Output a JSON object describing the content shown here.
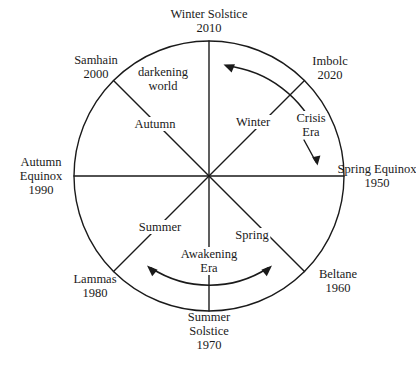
{
  "figure": {
    "background_color": "#ffffff",
    "stroke_color": "#1a1a1a",
    "circle": {
      "center_x": 209,
      "center_y": 176,
      "radius": 135
    }
  },
  "outer_labels": [
    {
      "name": "winter-solstice",
      "lines": [
        "Winter Solstice",
        "2010"
      ],
      "year": "2010",
      "angle_deg": 90,
      "x": 209,
      "y": 21
    },
    {
      "name": "imbolc",
      "lines": [
        "Imbolc",
        "2020"
      ],
      "year": "2020",
      "angle_deg": 45,
      "x": 330,
      "y": 68
    },
    {
      "name": "spring-equinox",
      "lines": [
        "Spring Equinox",
        "1950"
      ],
      "year": "1950",
      "angle_deg": 0,
      "x": 377,
      "y": 176
    },
    {
      "name": "beltane",
      "lines": [
        "Beltane",
        "1960"
      ],
      "year": "1960",
      "angle_deg": -45,
      "x": 338,
      "y": 281
    },
    {
      "name": "summer-solstice",
      "lines": [
        "Summer",
        "Solstice",
        "1970"
      ],
      "year": "1970",
      "angle_deg": -90,
      "x": 209,
      "y": 331
    },
    {
      "name": "lammas",
      "lines": [
        "Lammas",
        "1980"
      ],
      "year": "1980",
      "angle_deg": -135,
      "x": 95,
      "y": 286
    },
    {
      "name": "autumn-equinox",
      "lines": [
        "Autumn",
        "Equinox",
        "1990"
      ],
      "year": "1990",
      "angle_deg": 180,
      "x": 41,
      "y": 176
    },
    {
      "name": "samhain",
      "lines": [
        "Samhain",
        "2000"
      ],
      "year": "2000",
      "angle_deg": 135,
      "x": 96,
      "y": 67
    }
  ],
  "inner_labels": [
    {
      "name": "winter",
      "text": "Winter",
      "x": 253,
      "y": 122
    },
    {
      "name": "spring",
      "text": "Spring",
      "x": 252,
      "y": 235
    },
    {
      "name": "summer",
      "text": "Summer",
      "x": 160,
      "y": 227
    },
    {
      "name": "autumn",
      "text": "Autumn",
      "x": 155,
      "y": 124
    }
  ],
  "annotations": [
    {
      "name": "darkening-world",
      "lines": [
        "darkening",
        "world"
      ],
      "x": 163,
      "y": 79
    },
    {
      "name": "crisis-era",
      "lines": [
        "Crisis",
        "Era"
      ],
      "x": 311,
      "y": 125
    },
    {
      "name": "awakening-era",
      "lines": [
        "Awakening",
        "Era"
      ],
      "x": 209,
      "y": 261
    }
  ],
  "arcs": [
    {
      "name": "crisis-era-arc",
      "direction": "counterclockwise",
      "arrowheads": "single",
      "quadrant": "upper-right"
    },
    {
      "name": "awakening-era-arc",
      "direction": "bidirectional",
      "arrowheads": "double",
      "quadrant": "bottom"
    }
  ],
  "pointers": [
    {
      "name": "crisis-era-pointer",
      "direction": "down"
    }
  ]
}
